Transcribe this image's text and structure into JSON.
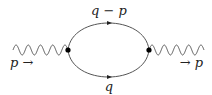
{
  "diagram": {
    "type": "feynman-self-energy-loop",
    "incoming_label": "p →",
    "outgoing_label": "→ p",
    "upper_propagator_label": "q − p",
    "lower_propagator_label": "q",
    "line_color": "#555555",
    "vertex_color": "#000000",
    "text_color": "#222222"
  }
}
